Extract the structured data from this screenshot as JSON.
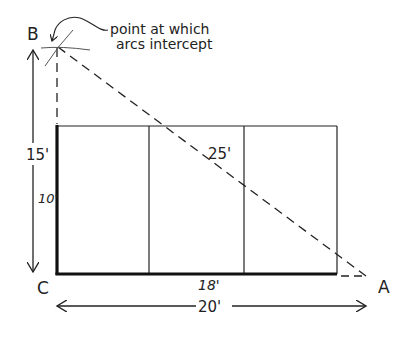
{
  "diagram": {
    "type": "geometry-layout",
    "points": {
      "A": {
        "label": "A"
      },
      "B": {
        "label": "B"
      },
      "C": {
        "label": "C"
      }
    },
    "annotation": {
      "line1": "point at which",
      "line2": "arcs intercept"
    },
    "dimensions": {
      "vertical_total": "15'",
      "vertical_side": "10'",
      "horizontal_side": "18'",
      "horizontal_total": "20'",
      "hypotenuse": "25'"
    },
    "colors": {
      "line": "#222222",
      "background": "#ffffff"
    }
  }
}
